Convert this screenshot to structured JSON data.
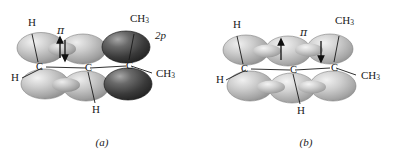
{
  "figure": {
    "width": 408,
    "height": 164,
    "background": "#ffffff"
  },
  "colors": {
    "lobe_light_edge": "#8c8c8c",
    "lobe_light_fill": "#b9b9b9",
    "lobe_light_highlight": "#f0f0f0",
    "lobe_dark_edge": "#2a2a2a",
    "lobe_dark_fill": "#3d3d3d",
    "lobe_dark_highlight": "#b0b0b0",
    "line": "#1a1a1a",
    "text": "#1a1a1a"
  },
  "panels": [
    {
      "id": "a",
      "caption": "(a)",
      "description": "Isolated 2p orbital adjacent to a pi bond",
      "labels": {
        "h_top_left": "H",
        "h_left": "H",
        "h_bottom": "H",
        "ch3_top_right": "CH",
        "ch3_top_right_sub": "3",
        "ch3_right": "CH",
        "ch3_right_sub": "3",
        "pi": "π",
        "two_p": "2p",
        "carbon_left": "C",
        "carbon_center": "C",
        "carbon_right": "C"
      },
      "electrons": {
        "style": "paired",
        "arrows": [
          {
            "direction": "up",
            "position": "center-left"
          },
          {
            "direction": "down",
            "position": "center-left"
          }
        ]
      },
      "orbital_shading": [
        "light",
        "light",
        "dark"
      ]
    },
    {
      "id": "b",
      "caption": "(b)",
      "description": "Delocalized conjugated pi system across three carbons",
      "labels": {
        "h_top_left": "H",
        "h_left": "H",
        "h_bottom": "H",
        "ch3_top_right": "CH",
        "ch3_top_right_sub": "3",
        "ch3_right": "CH",
        "ch3_right_sub": "3",
        "pi": "π",
        "carbon_left": "C",
        "carbon_center": "C",
        "carbon_right": "C"
      },
      "electrons": {
        "style": "separated",
        "arrows": [
          {
            "direction": "up",
            "position": "left-center"
          },
          {
            "direction": "down",
            "position": "right-center"
          }
        ]
      },
      "orbital_shading": [
        "light",
        "light",
        "light"
      ]
    }
  ]
}
